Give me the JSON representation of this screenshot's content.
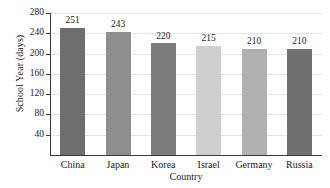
{
  "chart_data": {
    "type": "bar",
    "title": "",
    "xlabel": "Country",
    "ylabel": "School Year (days)",
    "categories": [
      "China",
      "Japan",
      "Korea",
      "Israel",
      "Germany",
      "Russia"
    ],
    "values": [
      251,
      243,
      220,
      215,
      210,
      210
    ],
    "value_labels": [
      "251",
      "243",
      "220",
      "215",
      "210",
      "210"
    ],
    "bar_colors": [
      "#6e6e6e",
      "#8e8e8e",
      "#7c7c7c",
      "#cfcfcf",
      "#b0b0b0",
      "#707070"
    ],
    "ylim": [
      0,
      280
    ],
    "yticks": [
      280,
      240,
      200,
      160,
      120,
      80,
      40
    ],
    "ytick_labels": [
      "280",
      "240",
      "200",
      "160",
      "120",
      "80",
      "40"
    ],
    "grid": true,
    "grid_axis": "y",
    "legend": false,
    "legend_position": "none",
    "axis_color": "#3a3a3a",
    "gridline_color": "#e3e3e3",
    "background_color": "#ffffff"
  }
}
